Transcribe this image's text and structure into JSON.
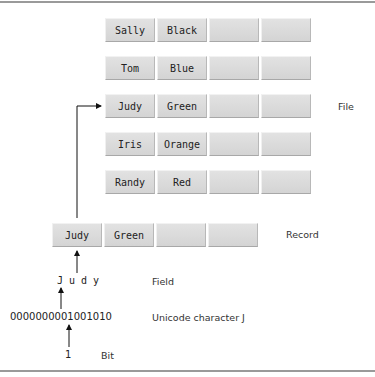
{
  "file": {
    "label": "File",
    "records": [
      {
        "first": "Sally",
        "second": "Black"
      },
      {
        "first": "Tom",
        "second": "Blue"
      },
      {
        "first": "Judy",
        "second": "Green"
      },
      {
        "first": "Iris",
        "second": "Orange"
      },
      {
        "first": "Randy",
        "second": "Red"
      }
    ]
  },
  "record": {
    "label": "Record",
    "first": "Judy",
    "second": "Green"
  },
  "field": {
    "label": "Field",
    "value": "J u d y"
  },
  "unicode": {
    "label": "Unicode character J",
    "high_byte": "00000000",
    "low_byte": "01001010"
  },
  "bit": {
    "label": "Bit",
    "value": "1"
  }
}
